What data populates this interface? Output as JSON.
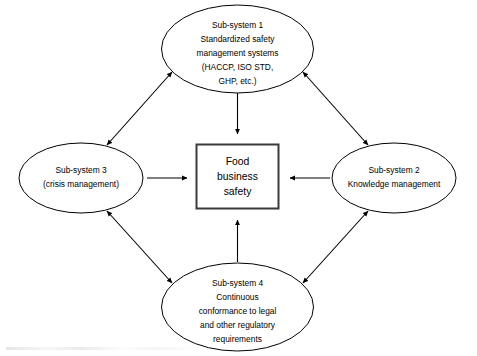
{
  "diagram": {
    "background_color": "#ffffff",
    "stroke_color": "#000000",
    "center_box_stroke_color": "#3a3a3a",
    "center": {
      "name": "Food business safety",
      "lines": [
        "Food",
        "business",
        "safety"
      ]
    },
    "nodes": [
      {
        "id": "sub-system-1",
        "position": "top",
        "lines": [
          "Sub-system 1",
          "Standardized safety",
          "management  systems",
          "(HACCP, ISO STD,",
          "GHP, etc.)"
        ]
      },
      {
        "id": "sub-system-2",
        "position": "right",
        "lines": [
          "Sub-system 2",
          "Knowledge management"
        ]
      },
      {
        "id": "sub-system-3",
        "position": "left",
        "lines": [
          "Sub-system 3",
          "(crisis management)"
        ]
      },
      {
        "id": "sub-system-4",
        "position": "bottom",
        "lines": [
          "Sub-system 4",
          "Continuous",
          "conformance to legal",
          "and other regulatory",
          "requirements"
        ]
      }
    ],
    "connectors": [
      {
        "id": "top-to-center",
        "from": "sub-system-1",
        "to": "center",
        "heads": "single",
        "direction": "down"
      },
      {
        "id": "left-to-center",
        "from": "sub-system-3",
        "to": "center",
        "heads": "single",
        "direction": "right"
      },
      {
        "id": "right-to-center",
        "from": "sub-system-2",
        "to": "center",
        "heads": "single",
        "direction": "left"
      },
      {
        "id": "bottom-to-center",
        "from": "sub-system-4",
        "to": "center",
        "heads": "single",
        "direction": "up"
      },
      {
        "id": "top-left-diagonal",
        "from": "sub-system-1",
        "to": "sub-system-3",
        "heads": "double",
        "direction": "bidirectional"
      },
      {
        "id": "top-right-diagonal",
        "from": "sub-system-1",
        "to": "sub-system-2",
        "heads": "double",
        "direction": "bidirectional"
      },
      {
        "id": "bottom-left-diagonal",
        "from": "sub-system-3",
        "to": "sub-system-4",
        "heads": "double",
        "direction": "bidirectional"
      },
      {
        "id": "bottom-right-diagonal",
        "from": "sub-system-2",
        "to": "sub-system-4",
        "heads": "double",
        "direction": "bidirectional"
      }
    ]
  }
}
